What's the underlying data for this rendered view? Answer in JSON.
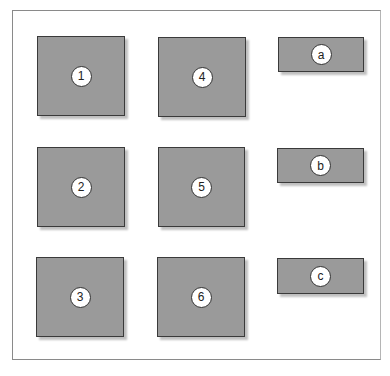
{
  "diagram": {
    "boxes": [
      {
        "id": "1",
        "label": "1",
        "kind": "square",
        "x": 37,
        "y": 36,
        "w": 88,
        "h": 80
      },
      {
        "id": "4",
        "label": "4",
        "kind": "square",
        "x": 158,
        "y": 37,
        "w": 88,
        "h": 80
      },
      {
        "id": "a",
        "label": "a",
        "kind": "rectangle",
        "x": 278,
        "y": 37,
        "w": 86,
        "h": 35
      },
      {
        "id": "2",
        "label": "2",
        "kind": "square",
        "x": 37,
        "y": 147,
        "w": 88,
        "h": 80
      },
      {
        "id": "5",
        "label": "5",
        "kind": "square",
        "x": 158,
        "y": 147,
        "w": 87,
        "h": 80
      },
      {
        "id": "b",
        "label": "b",
        "kind": "rectangle",
        "x": 277,
        "y": 148,
        "w": 87,
        "h": 35
      },
      {
        "id": "3",
        "label": "3",
        "kind": "square",
        "x": 36,
        "y": 257,
        "w": 88,
        "h": 80
      },
      {
        "id": "6",
        "label": "6",
        "kind": "square",
        "x": 157,
        "y": 257,
        "w": 88,
        "h": 80
      },
      {
        "id": "c",
        "label": "c",
        "kind": "rectangle",
        "x": 277,
        "y": 258,
        "w": 87,
        "h": 36
      }
    ],
    "colors": {
      "box_fill": "#9a9a9a",
      "box_border": "#3a3a3a",
      "label_fill": "#ffffff",
      "frame_border": "#8a8a8a"
    }
  }
}
